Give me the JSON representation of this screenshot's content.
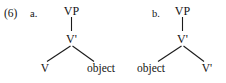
{
  "figure": {
    "example_number": "(6)",
    "trees": [
      {
        "letter": "a.",
        "root": "VP",
        "bar_node": "V'",
        "left_terminal": "V",
        "right_terminal": "object"
      },
      {
        "letter": "b.",
        "root": "VP",
        "bar_node": "V'",
        "left_terminal": "object",
        "right_terminal": "V'"
      }
    ],
    "colors": {
      "ink": "#141414",
      "line": "#1a1a1a",
      "background": "#ffffff"
    }
  }
}
